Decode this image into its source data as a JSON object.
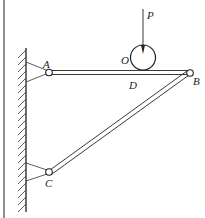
{
  "diagram": {
    "labels": {
      "A": "A",
      "B": "B",
      "C": "C",
      "D": "D",
      "O": "O",
      "P": "P"
    },
    "colors": {
      "stroke": "#222222",
      "background": "#ffffff"
    }
  }
}
